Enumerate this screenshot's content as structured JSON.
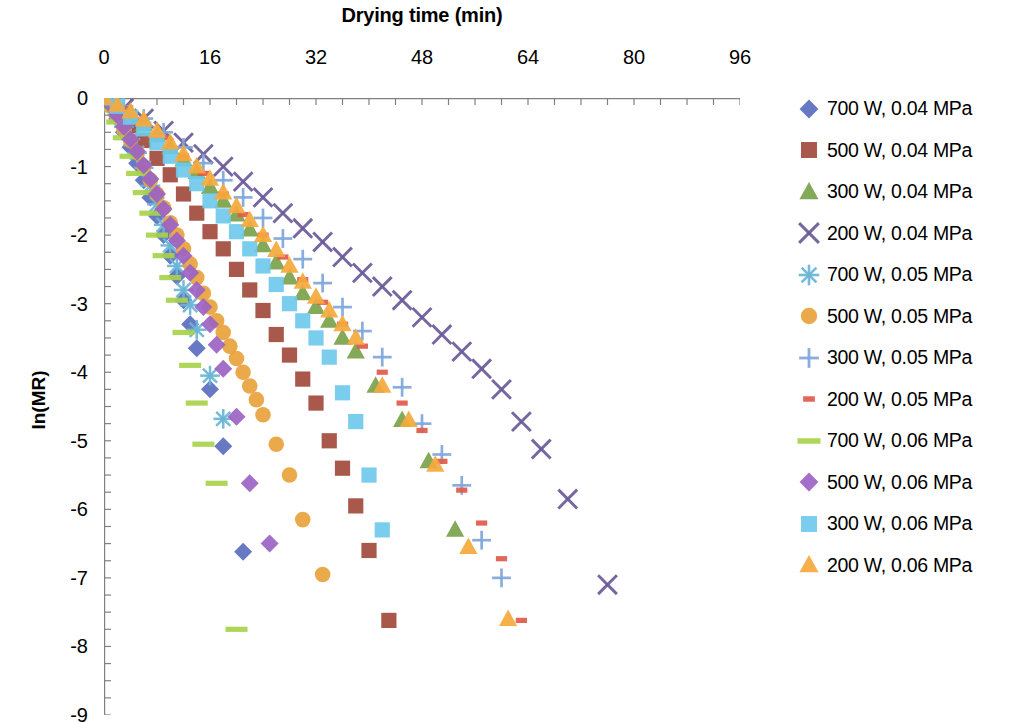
{
  "chart_data": {
    "type": "scatter",
    "title": "",
    "xlabel": "Drying time (min)",
    "ylabel": "ln(MR)",
    "xlim": [
      0,
      96
    ],
    "ylim": [
      -9,
      0
    ],
    "x_ticks": [
      0,
      16,
      32,
      48,
      64,
      80,
      96
    ],
    "x_minor_step": 4,
    "y_ticks": [
      0,
      -1,
      -2,
      -3,
      -4,
      -5,
      -6,
      -7,
      -8,
      -9
    ],
    "y_minor_step": 0.25,
    "x_axis_position": "top",
    "y_axis_position": "left",
    "grid": false,
    "legend_position": "right",
    "series": [
      {
        "name": "700 W, 0.04 MPa",
        "marker": "diamond",
        "color": "#5B6EBF",
        "points": [
          [
            0,
            0
          ],
          [
            1,
            -0.12
          ],
          [
            2,
            -0.3
          ],
          [
            3,
            -0.5
          ],
          [
            4,
            -0.72
          ],
          [
            5,
            -0.95
          ],
          [
            6,
            -1.2
          ],
          [
            7,
            -1.45
          ],
          [
            8,
            -1.72
          ],
          [
            9,
            -2.0
          ],
          [
            10,
            -2.3
          ],
          [
            11,
            -2.6
          ],
          [
            12,
            -2.95
          ],
          [
            13,
            -3.3
          ],
          [
            14,
            -3.65
          ],
          [
            16,
            -4.25
          ],
          [
            18,
            -5.08
          ],
          [
            21,
            -6.62
          ]
        ]
      },
      {
        "name": "500 W, 0.04 MPa",
        "marker": "square",
        "color": "#A14B3C",
        "points": [
          [
            0,
            0
          ],
          [
            2,
            -0.18
          ],
          [
            4,
            -0.4
          ],
          [
            6,
            -0.62
          ],
          [
            8,
            -0.88
          ],
          [
            10,
            -1.12
          ],
          [
            12,
            -1.4
          ],
          [
            14,
            -1.68
          ],
          [
            16,
            -1.95
          ],
          [
            18,
            -2.2
          ],
          [
            20,
            -2.5
          ],
          [
            22,
            -2.8
          ],
          [
            24,
            -3.1
          ],
          [
            26,
            -3.45
          ],
          [
            28,
            -3.75
          ],
          [
            30,
            -4.1
          ],
          [
            32,
            -4.45
          ],
          [
            34,
            -5.0
          ],
          [
            36,
            -5.4
          ],
          [
            38,
            -5.95
          ],
          [
            40,
            -6.6
          ],
          [
            43,
            -7.62
          ]
        ]
      },
      {
        "name": "300 W, 0.04 MPa",
        "marker": "triangle",
        "color": "#7AA24A",
        "points": [
          [
            0,
            0
          ],
          [
            2,
            -0.1
          ],
          [
            4,
            -0.22
          ],
          [
            6,
            -0.38
          ],
          [
            8,
            -0.55
          ],
          [
            10,
            -0.72
          ],
          [
            12,
            -0.9
          ],
          [
            14,
            -1.08
          ],
          [
            16,
            -1.3
          ],
          [
            18,
            -1.5
          ],
          [
            20,
            -1.7
          ],
          [
            22,
            -1.92
          ],
          [
            24,
            -2.15
          ],
          [
            26,
            -2.4
          ],
          [
            28,
            -2.62
          ],
          [
            30,
            -2.85
          ],
          [
            32,
            -3.05
          ],
          [
            34,
            -3.25
          ],
          [
            36,
            -3.5
          ],
          [
            38,
            -3.7
          ],
          [
            41,
            -4.2
          ],
          [
            45,
            -4.7
          ],
          [
            49,
            -5.3
          ],
          [
            53,
            -6.3
          ]
        ]
      },
      {
        "name": "200 W, 0.04 MPa",
        "marker": "x",
        "color": "#6B5B9A",
        "points": [
          [
            0,
            0
          ],
          [
            3,
            -0.15
          ],
          [
            6,
            -0.3
          ],
          [
            9,
            -0.48
          ],
          [
            12,
            -0.65
          ],
          [
            15,
            -0.82
          ],
          [
            18,
            -1.0
          ],
          [
            21,
            -1.22
          ],
          [
            24,
            -1.45
          ],
          [
            27,
            -1.68
          ],
          [
            30,
            -1.9
          ],
          [
            33,
            -2.1
          ],
          [
            36,
            -2.32
          ],
          [
            39,
            -2.55
          ],
          [
            42,
            -2.75
          ],
          [
            45,
            -2.95
          ],
          [
            48,
            -3.2
          ],
          [
            51,
            -3.45
          ],
          [
            54,
            -3.7
          ],
          [
            57,
            -3.95
          ],
          [
            60,
            -4.25
          ],
          [
            63,
            -4.72
          ],
          [
            66,
            -5.12
          ],
          [
            70,
            -5.85
          ],
          [
            76,
            -7.1
          ]
        ]
      },
      {
        "name": "700 W, 0.05 MPa",
        "marker": "asterisk",
        "color": "#6BB5D6",
        "points": [
          [
            0,
            0
          ],
          [
            1,
            -0.1
          ],
          [
            2,
            -0.25
          ],
          [
            3,
            -0.42
          ],
          [
            4,
            -0.6
          ],
          [
            5,
            -0.8
          ],
          [
            6,
            -1.02
          ],
          [
            7,
            -1.28
          ],
          [
            8,
            -1.55
          ],
          [
            9,
            -1.85
          ],
          [
            10,
            -2.15
          ],
          [
            11,
            -2.45
          ],
          [
            12,
            -2.8
          ],
          [
            13,
            -3.02
          ],
          [
            14,
            -3.38
          ],
          [
            16,
            -4.05
          ],
          [
            18,
            -4.68
          ]
        ]
      },
      {
        "name": "500 W, 0.05 MPa",
        "marker": "circle",
        "color": "#E8A33D",
        "points": [
          [
            0,
            0
          ],
          [
            1,
            -0.12
          ],
          [
            2,
            -0.28
          ],
          [
            3,
            -0.45
          ],
          [
            4,
            -0.62
          ],
          [
            5,
            -0.8
          ],
          [
            6,
            -1.0
          ],
          [
            7,
            -1.2
          ],
          [
            8,
            -1.4
          ],
          [
            9,
            -1.6
          ],
          [
            10,
            -1.82
          ],
          [
            11,
            -2.0
          ],
          [
            12,
            -2.2
          ],
          [
            13,
            -2.42
          ],
          [
            14,
            -2.62
          ],
          [
            15,
            -2.85
          ],
          [
            16,
            -3.05
          ],
          [
            17,
            -3.25
          ],
          [
            18,
            -3.42
          ],
          [
            19,
            -3.62
          ],
          [
            20,
            -3.8
          ],
          [
            21,
            -4.0
          ],
          [
            22,
            -4.2
          ],
          [
            23,
            -4.4
          ],
          [
            24,
            -4.62
          ],
          [
            26,
            -5.05
          ],
          [
            28,
            -5.5
          ],
          [
            30,
            -6.15
          ],
          [
            33,
            -6.95
          ]
        ]
      },
      {
        "name": "300 W, 0.05 MPa",
        "marker": "plus",
        "color": "#7FA8DC",
        "points": [
          [
            0,
            0
          ],
          [
            3,
            -0.12
          ],
          [
            6,
            -0.3
          ],
          [
            9,
            -0.5
          ],
          [
            12,
            -0.72
          ],
          [
            15,
            -0.95
          ],
          [
            18,
            -1.2
          ],
          [
            21,
            -1.45
          ],
          [
            24,
            -1.75
          ],
          [
            27,
            -2.05
          ],
          [
            30,
            -2.35
          ],
          [
            33,
            -2.7
          ],
          [
            36,
            -3.05
          ],
          [
            39,
            -3.4
          ],
          [
            42,
            -3.78
          ],
          [
            45,
            -4.22
          ],
          [
            48,
            -4.75
          ],
          [
            51,
            -5.2
          ],
          [
            54,
            -5.65
          ],
          [
            57,
            -6.45
          ],
          [
            60,
            -7.0
          ]
        ]
      },
      {
        "name": "200 W, 0.05 MPa",
        "marker": "dash",
        "color": "#E05A4A",
        "points": [
          [
            0,
            0
          ],
          [
            3,
            -0.15
          ],
          [
            6,
            -0.35
          ],
          [
            9,
            -0.58
          ],
          [
            12,
            -0.85
          ],
          [
            15,
            -1.1
          ],
          [
            18,
            -1.4
          ],
          [
            21,
            -1.7
          ],
          [
            24,
            -2.0
          ],
          [
            27,
            -2.32
          ],
          [
            30,
            -2.65
          ],
          [
            33,
            -2.98
          ],
          [
            36,
            -3.3
          ],
          [
            39,
            -3.62
          ],
          [
            42,
            -4.0
          ],
          [
            45,
            -4.45
          ],
          [
            48,
            -4.85
          ],
          [
            51,
            -5.3
          ],
          [
            54,
            -5.72
          ],
          [
            57,
            -6.2
          ],
          [
            60,
            -6.72
          ],
          [
            63,
            -7.62
          ]
        ]
      },
      {
        "name": "700 W, 0.06 MPa",
        "marker": "dash-long",
        "color": "#A8D14B",
        "points": [
          [
            0,
            0
          ],
          [
            1,
            -0.15
          ],
          [
            2,
            -0.35
          ],
          [
            3,
            -0.58
          ],
          [
            4,
            -0.85
          ],
          [
            5,
            -1.1
          ],
          [
            6,
            -1.38
          ],
          [
            7,
            -1.68
          ],
          [
            8,
            -2.0
          ],
          [
            9,
            -2.3
          ],
          [
            10,
            -2.62
          ],
          [
            11,
            -2.95
          ],
          [
            12,
            -3.42
          ],
          [
            13,
            -3.9
          ],
          [
            14,
            -4.45
          ],
          [
            15,
            -5.05
          ],
          [
            17,
            -5.62
          ],
          [
            20,
            -7.75
          ]
        ]
      },
      {
        "name": "500 W, 0.06 MPa",
        "marker": "diamond",
        "color": "#9B63C4",
        "points": [
          [
            0,
            0
          ],
          [
            1,
            -0.1
          ],
          [
            2,
            -0.25
          ],
          [
            3,
            -0.42
          ],
          [
            4,
            -0.6
          ],
          [
            5,
            -0.78
          ],
          [
            6,
            -0.98
          ],
          [
            7,
            -1.18
          ],
          [
            8,
            -1.4
          ],
          [
            9,
            -1.62
          ],
          [
            10,
            -1.85
          ],
          [
            11,
            -2.08
          ],
          [
            12,
            -2.3
          ],
          [
            13,
            -2.55
          ],
          [
            14,
            -2.8
          ],
          [
            15,
            -3.05
          ],
          [
            16,
            -3.3
          ],
          [
            17,
            -3.6
          ],
          [
            18,
            -3.95
          ],
          [
            20,
            -4.65
          ],
          [
            22,
            -5.62
          ],
          [
            25,
            -6.5
          ]
        ]
      },
      {
        "name": "300 W, 0.06 MPa",
        "marker": "square",
        "color": "#6FC9EC",
        "points": [
          [
            0,
            0
          ],
          [
            2,
            -0.12
          ],
          [
            4,
            -0.28
          ],
          [
            6,
            -0.45
          ],
          [
            8,
            -0.65
          ],
          [
            10,
            -0.85
          ],
          [
            12,
            -1.05
          ],
          [
            14,
            -1.25
          ],
          [
            16,
            -1.5
          ],
          [
            18,
            -1.72
          ],
          [
            20,
            -1.95
          ],
          [
            22,
            -2.2
          ],
          [
            24,
            -2.45
          ],
          [
            26,
            -2.72
          ],
          [
            28,
            -3.0
          ],
          [
            30,
            -3.25
          ],
          [
            32,
            -3.5
          ],
          [
            34,
            -3.78
          ],
          [
            36,
            -4.3
          ],
          [
            38,
            -4.72
          ],
          [
            40,
            -5.5
          ],
          [
            42,
            -6.3
          ]
        ]
      },
      {
        "name": "200 W, 0.06 MPa",
        "marker": "triangle",
        "color": "#F5A93C",
        "points": [
          [
            0,
            0
          ],
          [
            2,
            -0.1
          ],
          [
            4,
            -0.2
          ],
          [
            6,
            -0.32
          ],
          [
            8,
            -0.48
          ],
          [
            10,
            -0.65
          ],
          [
            12,
            -0.82
          ],
          [
            14,
            -1.0
          ],
          [
            16,
            -1.18
          ],
          [
            18,
            -1.38
          ],
          [
            20,
            -1.58
          ],
          [
            22,
            -1.78
          ],
          [
            24,
            -2.0
          ],
          [
            26,
            -2.22
          ],
          [
            28,
            -2.45
          ],
          [
            30,
            -2.68
          ],
          [
            32,
            -2.9
          ],
          [
            34,
            -3.1
          ],
          [
            36,
            -3.3
          ],
          [
            38,
            -3.5
          ],
          [
            42,
            -4.2
          ],
          [
            46,
            -4.7
          ],
          [
            50,
            -5.35
          ],
          [
            55,
            -6.55
          ],
          [
            61,
            -7.6
          ]
        ]
      }
    ]
  },
  "axes": {
    "x_tick_labels": [
      "0",
      "16",
      "32",
      "48",
      "64",
      "80",
      "96"
    ],
    "y_tick_labels": [
      "0",
      "-1",
      "-2",
      "-3",
      "-4",
      "-5",
      "-6",
      "-7",
      "-8",
      "-9"
    ],
    "x_title": "Drying time (min)",
    "y_title": "ln(MR)"
  },
  "legend": {
    "items": [
      {
        "label": "700 W, 0.04 MPa",
        "marker": "diamond",
        "color": "#5B6EBF"
      },
      {
        "label": "500 W, 0.04 MPa",
        "marker": "square",
        "color": "#A14B3C"
      },
      {
        "label": "300 W, 0.04 MPa",
        "marker": "triangle",
        "color": "#7AA24A"
      },
      {
        "label": "200 W, 0.04 MPa",
        "marker": "x",
        "color": "#6B5B9A"
      },
      {
        "label": "700 W, 0.05 MPa",
        "marker": "asterisk",
        "color": "#6BB5D6"
      },
      {
        "label": "500 W, 0.05 MPa",
        "marker": "circle",
        "color": "#E8A33D"
      },
      {
        "label": "300 W, 0.05 MPa",
        "marker": "plus",
        "color": "#7FA8DC"
      },
      {
        "label": "200 W, 0.05 MPa",
        "marker": "dash",
        "color": "#E05A4A"
      },
      {
        "label": "700 W, 0.06 MPa",
        "marker": "dash-long",
        "color": "#A8D14B"
      },
      {
        "label": "500 W, 0.06 MPa",
        "marker": "diamond",
        "color": "#9B63C4"
      },
      {
        "label": "300 W, 0.06 MPa",
        "marker": "square",
        "color": "#6FC9EC"
      },
      {
        "label": "200 W, 0.06 MPa",
        "marker": "triangle",
        "color": "#F5A93C"
      }
    ]
  },
  "style": {
    "axis_color": "#808080",
    "text_color": "#000000",
    "background": "#ffffff"
  }
}
